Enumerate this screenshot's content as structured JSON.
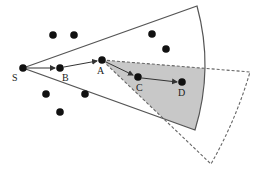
{
  "diagram": {
    "labels": {
      "S": "S",
      "B": "B",
      "A": "A",
      "C": "C",
      "D": "D"
    },
    "colors": {
      "background": "#ffffff",
      "node": "#111111",
      "solid_sector_stroke": "#555555",
      "dashed_sector_stroke": "#666666",
      "overlap_fill": "#c8c8c8",
      "arrow": "#333333"
    },
    "path": [
      "S",
      "B",
      "A",
      "C",
      "D"
    ],
    "sectors": [
      {
        "name": "solid-sector",
        "origin": "S",
        "style": "solid"
      },
      {
        "name": "dashed-sector",
        "origin": "A",
        "style": "dashed"
      }
    ],
    "other_nodes_count": 7
  }
}
